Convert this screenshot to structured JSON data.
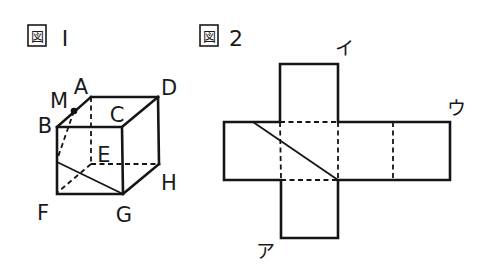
{
  "figure1": {
    "title_kanji": "図",
    "title_number": "I",
    "vertices": {
      "A": "A",
      "B": "B",
      "C": "C",
      "D": "D",
      "E": "E",
      "F": "F",
      "G": "G",
      "H": "H",
      "M": "M"
    },
    "description": "Cube ABCD-EFGH with point M on edge AB; cut line from M through edge BF to G"
  },
  "figure2": {
    "title_kanji": "図",
    "title_number": "2",
    "labels": {
      "a": "ア",
      "i": "イ",
      "u": "ウ"
    },
    "description": "Cross-shaped net of the cube with diagonal cut line"
  }
}
